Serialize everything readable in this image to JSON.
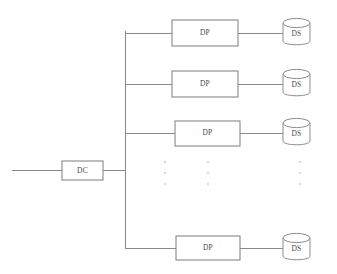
{
  "diagram": {
    "background_color": "#ffffff",
    "line_color": "#8a8a8a",
    "box_stroke_color": "#7d7d7d",
    "text_color": "#4a4a4a",
    "ellipsis_dot_color": "#cfcfcf",
    "controller": {
      "label": "DC",
      "shape": "rectangle",
      "x": 62,
      "y": 161,
      "width": 41,
      "height": 19
    },
    "input_line": {
      "name": "external-input-line",
      "x1": 12,
      "y1": 170.5,
      "x2": 62,
      "y2": 170.5
    },
    "bus": {
      "name": "vertical-bus",
      "x": 125,
      "y_top": 31,
      "y_bottom": 248,
      "stub_x1": 103,
      "stub_y": 170.5
    },
    "rows": [
      {
        "id": "row-1",
        "processor": {
          "label": "DP",
          "x": 172,
          "y": 20,
          "width": 66,
          "height": 26
        },
        "store": {
          "label": "DS",
          "cx": 296.5,
          "cy": 33,
          "rx": 13.5,
          "height": 26
        },
        "branch_y": 33
      },
      {
        "id": "row-2",
        "processor": {
          "label": "DP",
          "x": 172,
          "y": 71,
          "width": 66,
          "height": 26
        },
        "store": {
          "label": "DS",
          "cx": 296.5,
          "cy": 84,
          "rx": 13.5,
          "height": 26
        },
        "branch_y": 84
      },
      {
        "id": "row-3",
        "processor": {
          "label": "DP",
          "x": 175,
          "y": 121,
          "width": 65,
          "height": 25
        },
        "store": {
          "label": "DS",
          "cx": 296.5,
          "cy": 133,
          "rx": 13.5,
          "height": 26
        },
        "branch_y": 133
      },
      {
        "id": "row-4",
        "processor": {
          "label": "DP",
          "x": 176,
          "y": 236,
          "width": 64,
          "height": 24
        },
        "store": {
          "label": "DS",
          "cx": 296.5,
          "cy": 248,
          "rx": 13.5,
          "height": 26
        },
        "branch_y": 248
      }
    ],
    "ellipsis_columns": [
      {
        "name": "ellipsis-left",
        "x": 165,
        "dots_y": [
          162,
          173,
          184
        ]
      },
      {
        "name": "ellipsis-center",
        "x": 208,
        "dots_y": [
          162,
          173,
          184
        ]
      },
      {
        "name": "ellipsis-right",
        "x": 300,
        "dots_y": [
          162,
          173,
          184
        ]
      }
    ]
  }
}
